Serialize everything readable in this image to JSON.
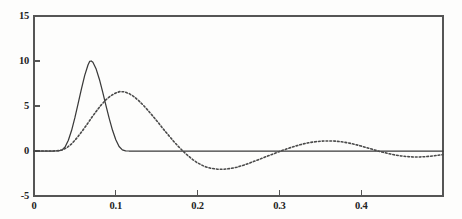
{
  "chart_data": {
    "type": "line",
    "title": "",
    "subtitle": "",
    "xlabel": "",
    "ylabel": "",
    "xlim": [
      0.0,
      0.5
    ],
    "ylim": [
      -5,
      15
    ],
    "grid": false,
    "legend": "none",
    "x_ticks": [
      0,
      0.1,
      0.2,
      0.3,
      0.4
    ],
    "x_tick_labels": [
      "0",
      "0.1",
      "0.2",
      "0.3",
      "0.4"
    ],
    "y_ticks": [
      -5,
      0,
      5,
      10,
      15
    ],
    "y_tick_labels": [
      "-5",
      "0",
      "5",
      "10",
      "15"
    ],
    "series": [
      {
        "name": "solid",
        "style": "solid",
        "color": "#3a3a3a",
        "peak_x": 0.068,
        "peak_y": 10.0,
        "points": [
          [
            0.0,
            0.0
          ],
          [
            0.005,
            0.0
          ],
          [
            0.01,
            0.0
          ],
          [
            0.015,
            0.0
          ],
          [
            0.02,
            0.0
          ],
          [
            0.025,
            0.0
          ],
          [
            0.03,
            0.02
          ],
          [
            0.034,
            0.1
          ],
          [
            0.038,
            0.45
          ],
          [
            0.042,
            1.2
          ],
          [
            0.046,
            2.3
          ],
          [
            0.05,
            3.7
          ],
          [
            0.054,
            5.3
          ],
          [
            0.058,
            6.9
          ],
          [
            0.062,
            8.4
          ],
          [
            0.066,
            9.55
          ],
          [
            0.068,
            9.95
          ],
          [
            0.07,
            10.0
          ],
          [
            0.072,
            9.85
          ],
          [
            0.076,
            9.1
          ],
          [
            0.08,
            7.95
          ],
          [
            0.084,
            6.55
          ],
          [
            0.088,
            5.05
          ],
          [
            0.092,
            3.6
          ],
          [
            0.096,
            2.3
          ],
          [
            0.1,
            1.25
          ],
          [
            0.104,
            0.5
          ],
          [
            0.108,
            0.12
          ],
          [
            0.112,
            0.01
          ],
          [
            0.116,
            0.0
          ],
          [
            0.13,
            0.0
          ],
          [
            0.16,
            0.0
          ],
          [
            0.2,
            0.0
          ],
          [
            0.25,
            0.0
          ],
          [
            0.3,
            0.0
          ],
          [
            0.35,
            0.0
          ],
          [
            0.4,
            0.0
          ],
          [
            0.45,
            0.0
          ],
          [
            0.5,
            0.0
          ]
        ]
      },
      {
        "name": "dashed",
        "style": "dotted",
        "color": "#4a4a4a",
        "peak_x": 0.105,
        "peak_y": 6.6,
        "points": [
          [
            0.0,
            0.0
          ],
          [
            0.01,
            0.0
          ],
          [
            0.02,
            0.0
          ],
          [
            0.028,
            0.02
          ],
          [
            0.034,
            0.1
          ],
          [
            0.04,
            0.35
          ],
          [
            0.046,
            0.8
          ],
          [
            0.052,
            1.4
          ],
          [
            0.058,
            2.1
          ],
          [
            0.064,
            2.85
          ],
          [
            0.07,
            3.65
          ],
          [
            0.076,
            4.4
          ],
          [
            0.082,
            5.1
          ],
          [
            0.088,
            5.7
          ],
          [
            0.094,
            6.15
          ],
          [
            0.1,
            6.45
          ],
          [
            0.105,
            6.6
          ],
          [
            0.11,
            6.58
          ],
          [
            0.116,
            6.4
          ],
          [
            0.122,
            6.05
          ],
          [
            0.128,
            5.6
          ],
          [
            0.134,
            5.05
          ],
          [
            0.14,
            4.45
          ],
          [
            0.146,
            3.8
          ],
          [
            0.152,
            3.15
          ],
          [
            0.158,
            2.45
          ],
          [
            0.164,
            1.8
          ],
          [
            0.17,
            1.15
          ],
          [
            0.176,
            0.55
          ],
          [
            0.182,
            0.0
          ],
          [
            0.188,
            -0.5
          ],
          [
            0.194,
            -0.95
          ],
          [
            0.2,
            -1.32
          ],
          [
            0.208,
            -1.7
          ],
          [
            0.216,
            -1.92
          ],
          [
            0.224,
            -2.02
          ],
          [
            0.232,
            -2.03
          ],
          [
            0.24,
            -1.95
          ],
          [
            0.248,
            -1.8
          ],
          [
            0.256,
            -1.58
          ],
          [
            0.264,
            -1.32
          ],
          [
            0.272,
            -1.05
          ],
          [
            0.28,
            -0.76
          ],
          [
            0.288,
            -0.48
          ],
          [
            0.296,
            -0.2
          ],
          [
            0.304,
            0.08
          ],
          [
            0.312,
            0.33
          ],
          [
            0.32,
            0.56
          ],
          [
            0.328,
            0.76
          ],
          [
            0.336,
            0.92
          ],
          [
            0.344,
            1.03
          ],
          [
            0.352,
            1.1
          ],
          [
            0.36,
            1.12
          ],
          [
            0.368,
            1.1
          ],
          [
            0.376,
            1.02
          ],
          [
            0.384,
            0.9
          ],
          [
            0.392,
            0.74
          ],
          [
            0.4,
            0.55
          ],
          [
            0.408,
            0.34
          ],
          [
            0.416,
            0.12
          ],
          [
            0.424,
            -0.08
          ],
          [
            0.432,
            -0.26
          ],
          [
            0.44,
            -0.42
          ],
          [
            0.448,
            -0.54
          ],
          [
            0.456,
            -0.62
          ],
          [
            0.464,
            -0.66
          ],
          [
            0.472,
            -0.66
          ],
          [
            0.48,
            -0.62
          ],
          [
            0.488,
            -0.55
          ],
          [
            0.494,
            -0.48
          ],
          [
            0.5,
            -0.4
          ]
        ]
      }
    ],
    "axis_color": "#555555",
    "background_color": "#fdfdfc"
  },
  "axes": {
    "frame": {
      "left": 34,
      "right": 443,
      "top": 16,
      "bottom": 196
    }
  }
}
